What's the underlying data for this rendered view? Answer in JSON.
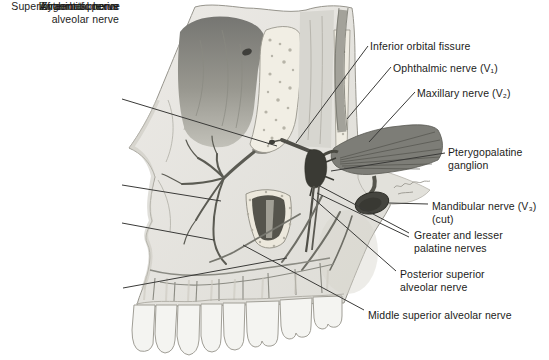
{
  "figure": {
    "colors": {
      "background": "#ffffff",
      "bone": "#e6e5e1",
      "bone_outline": "#97958d",
      "orbit_dark": "#767672",
      "cut_bone_speckled": "#f1eee4",
      "nerve_gray": "#5b5b53",
      "ganglion_dark": "#3a3a34",
      "mandibular_cut_dark": "#45453f",
      "teeth": "#f4f4f1",
      "leader_line": "#3a3a38",
      "label_text": "#1c1c1a"
    }
  },
  "labels": [
    {
      "name": "zygomatic-nerve",
      "text": "Zygomatic nerve"
    },
    {
      "name": "infraorbital-nerve",
      "text": "Infraorbital nerve"
    },
    {
      "name": "anterior-superior-alveolar-nerve",
      "text": "Anterior superior\nalveolar nerve"
    },
    {
      "name": "superior-dental-plexus",
      "text": "Superior dental plexus"
    },
    {
      "name": "inferior-orbital-fissure",
      "text": "Inferior orbital fissure"
    },
    {
      "name": "ophthalmic-nerve-v1",
      "text": "Ophthalmic nerve (V₁)"
    },
    {
      "name": "maxillary-nerve-v2",
      "text": "Maxillary nerve (V₂)"
    },
    {
      "name": "pterygopalatine-ganglion",
      "text": "Pterygopalatine\nganglion"
    },
    {
      "name": "mandibular-nerve-v3-cut",
      "text": "Mandibular nerve (V₃)\n(cut)"
    },
    {
      "name": "greater-lesser-palatine-nerves",
      "text": "Greater and lesser\npalatine nerves"
    },
    {
      "name": "posterior-superior-alveolar-nerve",
      "text": "Posterior superior\nalveolar nerve"
    },
    {
      "name": "middle-superior-alveolar-nerve",
      "text": "Middle superior alveolar nerve"
    }
  ]
}
